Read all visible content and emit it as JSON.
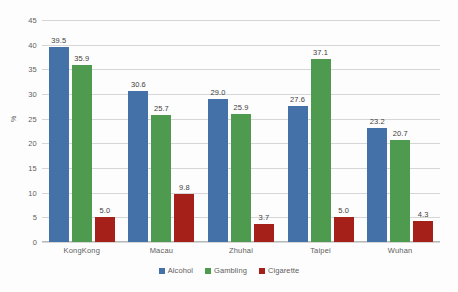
{
  "chart_data": {
    "type": "bar",
    "title": "",
    "subtitle": "",
    "xlabel": "",
    "ylabel": "%",
    "ylim": [
      0,
      45
    ],
    "ytick_step": 5,
    "yticks": [
      45,
      40,
      35,
      30,
      25,
      20,
      15,
      10,
      5,
      0
    ],
    "grid": true,
    "legend_position": "bottom-center",
    "categories": [
      "KongKong",
      "Macau",
      "Zhuhai",
      "Taipei",
      "Wuhan"
    ],
    "series": [
      {
        "name": "Alcohol",
        "color": "#4472a8",
        "values": [
          39.5,
          30.6,
          29.0,
          27.6,
          23.2
        ],
        "labels": [
          "39.5",
          "30.6",
          "29.0",
          "27.6",
          "23.2"
        ]
      },
      {
        "name": "Gambling",
        "color": "#4e9a4e",
        "values": [
          35.9,
          25.7,
          25.9,
          37.1,
          20.7
        ],
        "labels": [
          "35.9",
          "25.7",
          "25.9",
          "37.1",
          "20.7"
        ]
      },
      {
        "name": "Cigarette",
        "color": "#a52019",
        "values": [
          5.0,
          9.8,
          3.7,
          5.0,
          4.3
        ],
        "labels": [
          "5.0",
          "9.8",
          "3.7",
          "5.0",
          "4.3"
        ]
      }
    ]
  }
}
